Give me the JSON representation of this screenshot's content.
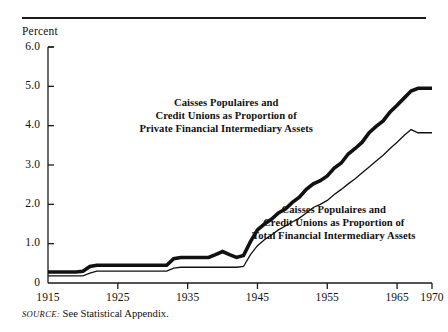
{
  "figure": {
    "axis_title": "Percent",
    "source_prefix": "SOURCE:",
    "source_text": "See Statistical Appendix."
  },
  "chart_data": {
    "type": "line",
    "title": "",
    "xlabel": "",
    "ylabel": "Percent",
    "xlim": [
      1915,
      1970
    ],
    "ylim": [
      0,
      6.0
    ],
    "grid": false,
    "legend_position": "inline-annotation",
    "xticks": [
      1915,
      1925,
      1935,
      1945,
      1955,
      1965,
      1970
    ],
    "xtick_labels": [
      "1915",
      "1925",
      "1935",
      "1945",
      "1955",
      "1965",
      "1970"
    ],
    "yticks": [
      0,
      1.0,
      2.0,
      3.0,
      4.0,
      5.0,
      6.0
    ],
    "ytick_labels": [
      "0",
      "1.0",
      "2.0",
      "3.0",
      "4.0",
      "5.0",
      "6.0"
    ],
    "annotations": [
      {
        "name": "private-assets-label",
        "lines": [
          "Caisses Populaires and",
          "Credit Unions as Proportion of",
          "Private Financial Intermediary Assets"
        ],
        "x": 226,
        "y": 116
      },
      {
        "name": "total-assets-label",
        "lines": [
          "Caisses Populaires and",
          "Credit Unions as Proportion of",
          "Total Financial Intermediary Assets"
        ],
        "x": 334,
        "y": 223
      }
    ],
    "series": [
      {
        "name": "Caisses Populaires and Credit Unions as Proportion of Private Financial Intermediary Assets",
        "style": "thick",
        "x": [
          1915,
          1917,
          1919,
          1920,
          1921,
          1922,
          1923,
          1925,
          1927,
          1929,
          1931,
          1932,
          1933,
          1934,
          1935,
          1936,
          1937,
          1938,
          1939,
          1940,
          1941,
          1942,
          1943,
          1944,
          1945,
          1946,
          1947,
          1948,
          1949,
          1950,
          1951,
          1952,
          1953,
          1954,
          1955,
          1956,
          1957,
          1958,
          1959,
          1960,
          1961,
          1962,
          1963,
          1964,
          1965,
          1966,
          1967,
          1968,
          1969,
          1970
        ],
        "values": [
          0.28,
          0.28,
          0.28,
          0.3,
          0.42,
          0.45,
          0.45,
          0.45,
          0.45,
          0.45,
          0.45,
          0.45,
          0.62,
          0.65,
          0.65,
          0.65,
          0.65,
          0.65,
          0.72,
          0.8,
          0.72,
          0.65,
          0.7,
          1.05,
          1.35,
          1.5,
          1.62,
          1.78,
          1.88,
          2.05,
          2.18,
          2.38,
          2.52,
          2.6,
          2.72,
          2.92,
          3.05,
          3.28,
          3.42,
          3.58,
          3.82,
          3.98,
          4.12,
          4.35,
          4.52,
          4.7,
          4.88,
          4.95,
          4.95,
          4.95
        ]
      },
      {
        "name": "Caisses Populaires and Credit Unions as Proportion of Total Financial Intermediary Assets",
        "style": "thin",
        "x": [
          1915,
          1917,
          1919,
          1920,
          1921,
          1922,
          1923,
          1925,
          1927,
          1929,
          1931,
          1932,
          1933,
          1934,
          1935,
          1936,
          1937,
          1938,
          1939,
          1940,
          1941,
          1942,
          1943,
          1944,
          1945,
          1946,
          1947,
          1948,
          1949,
          1950,
          1951,
          1952,
          1953,
          1954,
          1955,
          1956,
          1957,
          1958,
          1959,
          1960,
          1961,
          1962,
          1963,
          1964,
          1965,
          1966,
          1967,
          1968,
          1969,
          1970
        ],
        "values": [
          0.18,
          0.18,
          0.18,
          0.18,
          0.25,
          0.3,
          0.3,
          0.3,
          0.3,
          0.3,
          0.3,
          0.3,
          0.38,
          0.4,
          0.4,
          0.4,
          0.4,
          0.4,
          0.4,
          0.4,
          0.4,
          0.4,
          0.42,
          0.72,
          0.95,
          1.1,
          1.22,
          1.35,
          1.45,
          1.55,
          1.65,
          1.78,
          1.92,
          2.0,
          2.1,
          2.25,
          2.38,
          2.52,
          2.65,
          2.8,
          2.95,
          3.1,
          3.25,
          3.42,
          3.58,
          3.75,
          3.9,
          3.82,
          3.82,
          3.82
        ]
      }
    ]
  }
}
